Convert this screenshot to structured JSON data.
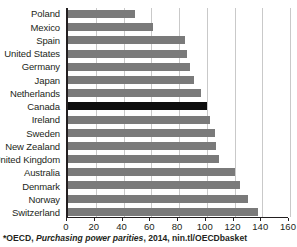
{
  "chart_data": {
    "type": "bar",
    "orientation": "horizontal",
    "title": "",
    "subtitle": "",
    "xlabel": "",
    "ylabel": "",
    "xlim": [
      0,
      160
    ],
    "ylim": null,
    "grid": true,
    "legend": null,
    "xticks": [
      0,
      20,
      40,
      60,
      80,
      100,
      120,
      140,
      160
    ],
    "xtick_labels": [
      "0",
      "20",
      "40",
      "60",
      "80",
      "100",
      "120",
      "140",
      "160"
    ],
    "categories": [
      "Poland",
      "Mexico",
      "Spain",
      "United States",
      "Germany",
      "Japan",
      "Netherlands",
      "Canada",
      "Ireland",
      "Sweden",
      "New Zealand",
      "United Kingdom",
      "Australia",
      "Denmark",
      "Norway",
      "Switzerland"
    ],
    "values": [
      48,
      61,
      84,
      86,
      88,
      91,
      96,
      100,
      102,
      106,
      107,
      109,
      120,
      124,
      130,
      137
    ],
    "highlight_category": "Canada",
    "colors": {
      "bar": "#7a7a7a",
      "bar_highlight": "#0d0d0d",
      "grid": "#c9c9c9",
      "axis": "#231f20",
      "background": "#ffffff"
    }
  },
  "footnote": {
    "prefix": "*OECD, ",
    "italic": "Purchasing power parities",
    "suffix": ", 2014, nin.tl/OECDbasket",
    "full": "*OECD, Purchasing power parities, 2014, nin.tl/OECDbasket"
  }
}
